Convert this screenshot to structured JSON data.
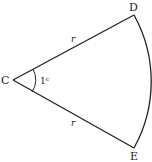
{
  "diagram": {
    "type": "circle-sector",
    "points": {
      "center": {
        "label": "C",
        "x": 13,
        "y": 80
      },
      "upper": {
        "label": "D",
        "x": 134,
        "y": 15
      },
      "lower": {
        "label": "E",
        "x": 134,
        "y": 148
      }
    },
    "radius_labels": {
      "upper": "r",
      "lower": "r"
    },
    "angle": {
      "value": "1",
      "unit": "c"
    },
    "colors": {
      "stroke": "#222222",
      "background": "#ffffff"
    }
  }
}
